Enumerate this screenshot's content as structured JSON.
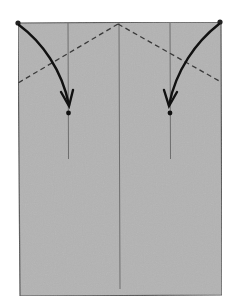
{
  "diagram": {
    "type": "origami-fold-instruction",
    "caption": "",
    "colors": {
      "paper": "#b3b3b3",
      "paper_edge": "#555555",
      "crease": "#6e6e6e",
      "dashed_fold": "#3a3a3a",
      "arrow": "#111111",
      "background": "#ffffff"
    },
    "paper": {
      "x1": 18,
      "y1": 23,
      "x2": 221,
      "y2": 295
    },
    "creases": [
      {
        "name": "left-crease",
        "x": 68,
        "y1": 23,
        "y2": 159
      },
      {
        "name": "center-crease",
        "x": 119,
        "y1": 23,
        "y2": 289
      },
      {
        "name": "right-crease",
        "x": 170,
        "y1": 23,
        "y2": 159
      }
    ],
    "valley_folds": [
      {
        "name": "left-valley-fold",
        "from": [
          118,
          24
        ],
        "to": [
          18,
          83
        ]
      },
      {
        "name": "right-valley-fold",
        "from": [
          118,
          24
        ],
        "to": [
          221,
          82
        ]
      }
    ],
    "arrows": [
      {
        "name": "left-fold-arrow",
        "start": [
          18,
          23
        ],
        "end": [
          69,
          106
        ],
        "target_dot": [
          68,
          113
        ]
      },
      {
        "name": "right-fold-arrow",
        "start": [
          220,
          22
        ],
        "end": [
          169,
          106
        ],
        "target_dot": [
          170,
          113
        ]
      }
    ]
  }
}
